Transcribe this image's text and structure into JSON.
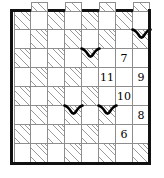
{
  "puzzle": {
    "title": "logic-grid-puzzle",
    "grid": {
      "rows": 8,
      "columns": 8,
      "cell_border_color": "#8d8d8d",
      "hatch_color": "#9a9a9a",
      "outer_border_color": "#111111"
    },
    "clues": [
      {
        "row": 2,
        "col": 6,
        "value": "7"
      },
      {
        "row": 3,
        "col": 5,
        "value": "11"
      },
      {
        "row": 3,
        "col": 7,
        "value": "9"
      },
      {
        "row": 4,
        "col": 6,
        "value": "10"
      },
      {
        "row": 5,
        "col": 7,
        "value": "8"
      },
      {
        "row": 6,
        "col": 6,
        "value": "6"
      }
    ],
    "marks": [
      {
        "name": "bird-mark-1",
        "row": 1,
        "col": 7,
        "glyph": "v-mark"
      },
      {
        "name": "bird-mark-2",
        "row": 2,
        "col": 4,
        "glyph": "v-mark"
      },
      {
        "name": "bird-mark-3",
        "row": 5,
        "col": 3,
        "glyph": "v-mark"
      },
      {
        "name": "bird-mark-4",
        "row": 5,
        "col": 5,
        "glyph": "v-mark"
      }
    ],
    "top_tabs": [
      1,
      3,
      5,
      7
    ]
  }
}
